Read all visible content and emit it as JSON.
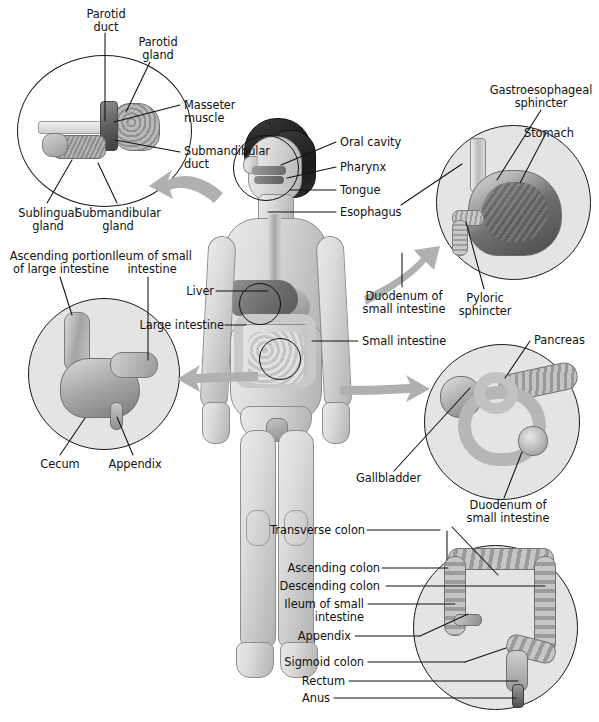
{
  "figure": {
    "background_color": "#ffffff",
    "width": 599,
    "height": 722,
    "line_color": "#111111",
    "arrow_color": "#aaaaaa",
    "inset_fill": "#e4e4e4",
    "skin_color": "#d4d4d4",
    "hair_color": "#262626"
  },
  "caption": "",
  "insets": {
    "salivary": {
      "name": "Salivary glands inset",
      "labels": {
        "parotid_duct": "Parotid\nduct",
        "parotid_gland": "Parotid\ngland",
        "masseter_muscle": "Masseter\nmuscle",
        "submandibular_duct": "Submandibular\nduct",
        "sublingual_gland": "Sublingual\ngland",
        "submandibular_gland": "Submandibular\ngland"
      }
    },
    "stomach": {
      "name": "Stomach inset",
      "labels": {
        "gastroesophageal_sphincter": "Gastroesophageal\nsphincter",
        "stomach": "Stomach",
        "duodenum": "Duodenum of\nsmall intestine",
        "pyloric_sphincter": "Pyloric\nsphincter"
      }
    },
    "cecum": {
      "name": "Cecum and appendix inset",
      "labels": {
        "ascending_portion": "Ascending portion\nof large intestine",
        "ileum": "Ileum of small\nintestine",
        "cecum": "Cecum",
        "appendix": "Appendix"
      }
    },
    "pancreas": {
      "name": "Pancreas and gallbladder inset",
      "labels": {
        "pancreas": "Pancreas",
        "gallbladder": "Gallbladder",
        "duodenum": "Duodenum of\nsmall intestine"
      }
    },
    "colon": {
      "name": "Large intestine colon inset",
      "labels": {
        "transverse_colon": "Transverse colon",
        "ascending_colon": "Ascending colon",
        "descending_colon": "Descending colon",
        "ileum": "Ileum of small\nintestine",
        "appendix": "Appendix",
        "sigmoid_colon": "Sigmoid colon",
        "rectum": "Rectum",
        "anus": "Anus"
      }
    }
  },
  "body_labels": {
    "oral_cavity": "Oral cavity",
    "pharynx": "Pharynx",
    "tongue": "Tongue",
    "esophagus": "Esophagus",
    "liver": "Liver",
    "large_intestine": "Large intestine",
    "small_intestine": "Small intestine"
  }
}
